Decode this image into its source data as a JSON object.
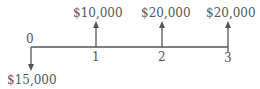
{
  "diagram": {
    "type": "cash-flow-diagram",
    "periods": [
      "0",
      "1",
      "2",
      "3"
    ],
    "cash_flows": [
      {
        "period": "0",
        "amount": "$15,000",
        "direction": "down"
      },
      {
        "period": "1",
        "amount": "$10,000",
        "direction": "up"
      },
      {
        "period": "2",
        "amount": "$20,000",
        "direction": "up"
      },
      {
        "period": "3",
        "amount": "$20,000",
        "direction": "up"
      }
    ],
    "colors": {
      "line": "#555555",
      "text": "#555555"
    }
  }
}
